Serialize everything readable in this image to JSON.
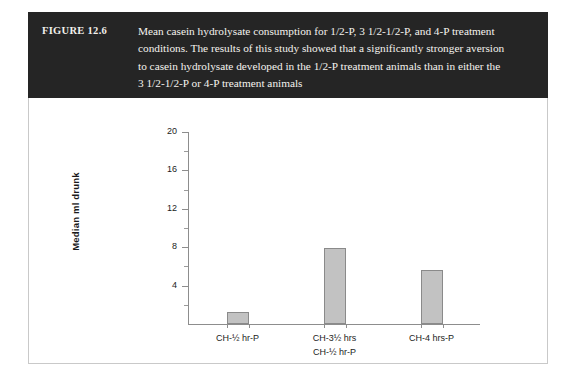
{
  "figure": {
    "number_label": "FIGURE 12.6",
    "caption_lines": [
      "Mean casein hydrolysate consumption for 1/2-P, 3 1/2-1/2-P, and 4-P treatment",
      "conditions. The results of this study showed that a significantly stronger aversion",
      "to casein hydrolysate developed in the 1/2-P treatment animals than in either the",
      "3 1/2-1/2-P or 4-P treatment animals"
    ],
    "banner_color": "#252525",
    "banner_text_color": "#f4f2ee",
    "frame_border_color": "#c9c9c9"
  },
  "chart_data": {
    "type": "bar",
    "title": "",
    "xlabel": "",
    "ylabel": "Median ml drunk",
    "categories": [
      "CH-½ hr-P",
      "CH-3½ hrs\nCH-½ hr-P",
      "CH-4 hrs-P"
    ],
    "category_lines": [
      [
        "CH-½ hr-P"
      ],
      [
        "CH-3½ hrs",
        "CH-½ hr-P"
      ],
      [
        "CH-4 hrs-P"
      ]
    ],
    "values": [
      1.3,
      7.9,
      5.6
    ],
    "ylim": [
      0,
      20
    ],
    "yticks": [
      4,
      8,
      12,
      16,
      20
    ],
    "ytick_labels": [
      "4",
      "8",
      "12",
      "16",
      "20"
    ],
    "y_minor_ticks": [
      2,
      6,
      10,
      14,
      18
    ],
    "grid": false,
    "legend": false,
    "bar_fill_color": "#c2c2c2",
    "bar_edge_color": "#8a8a8a",
    "axis_color": "#8d8d8d"
  }
}
